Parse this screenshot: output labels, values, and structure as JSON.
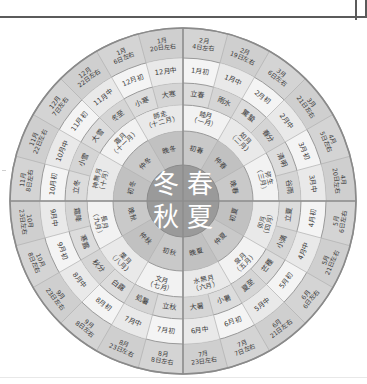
{
  "diagram": {
    "colors": {
      "core": "#9a9a9a",
      "ring_season": "#c9c9c9",
      "ring_month_jp": "#f2f2f2",
      "ring_term": "#dcdcdc",
      "ring_month_mid": "#f4f4f4",
      "ring_date": "#d4d4d4",
      "outline": "#9a9a9a",
      "cross": "#8e8e8e",
      "text": "#3a3a3a"
    },
    "center_seasons": [
      {
        "label": "冬",
        "position": "top-left"
      },
      {
        "label": "春",
        "position": "top-right"
      },
      {
        "label": "秋",
        "position": "bottom-left"
      },
      {
        "label": "夏",
        "position": "bottom-right"
      }
    ],
    "ring_names": {
      "r1_center": "季節",
      "r2": "季節の区分",
      "r3": "和風月名",
      "r4": "二十四節気",
      "r5": "旧暦月",
      "r6": "新暦日付"
    },
    "segments": [
      {
        "i": 0,
        "season": "春",
        "sub_season": "初春",
        "jp_month": "睦月（一月）",
        "term": "立春",
        "lunar": "1月初",
        "date": "2月4日左右"
      },
      {
        "i": 1,
        "season": "春",
        "sub_season": "初春",
        "jp_month": "睦月（一月）",
        "term": "雨水",
        "lunar": "1月中",
        "date": "2月19日左右"
      },
      {
        "i": 2,
        "season": "春",
        "sub_season": "仲春",
        "jp_month": "如月（二月）",
        "term": "驚蟄",
        "lunar": "2月初",
        "date": "3月6日左右"
      },
      {
        "i": 3,
        "season": "春",
        "sub_season": "仲春",
        "jp_month": "如月（二月）",
        "term": "春分",
        "lunar": "2月中",
        "date": "3月21日左右"
      },
      {
        "i": 4,
        "season": "春",
        "sub_season": "晚春",
        "jp_month": "弥生（三月）",
        "term": "清明",
        "lunar": "3月初",
        "date": "4月5日左右"
      },
      {
        "i": 5,
        "season": "春",
        "sub_season": "晚春",
        "jp_month": "弥生（三月）",
        "term": "谷雨",
        "lunar": "3月中",
        "date": "4月20日左右"
      },
      {
        "i": 6,
        "season": "夏",
        "sub_season": "初夏",
        "jp_month": "卯月（四月）",
        "term": "立夏",
        "lunar": "4月初",
        "date": "5月6日左右"
      },
      {
        "i": 7,
        "season": "夏",
        "sub_season": "初夏",
        "jp_month": "卯月（四月）",
        "term": "小満",
        "lunar": "4月中",
        "date": "5月21日左右"
      },
      {
        "i": 8,
        "season": "夏",
        "sub_season": "仲夏",
        "jp_month": "皐月（五月）",
        "term": "芒種",
        "lunar": "5月初",
        "date": "6月6日左右"
      },
      {
        "i": 9,
        "season": "夏",
        "sub_season": "仲夏",
        "jp_month": "皐月（五月）",
        "term": "夏至",
        "lunar": "5月中",
        "date": "6月21日左右"
      },
      {
        "i": 10,
        "season": "夏",
        "sub_season": "晚夏",
        "jp_month": "水無月（六月）",
        "term": "小暑",
        "lunar": "6月初",
        "date": "7月7日左右"
      },
      {
        "i": 11,
        "season": "夏",
        "sub_season": "晚夏",
        "jp_month": "水無月（六月）",
        "term": "大暑",
        "lunar": "6月中",
        "date": "7月23日左右"
      },
      {
        "i": 12,
        "season": "秋",
        "sub_season": "初秋",
        "jp_month": "文月（七月）",
        "term": "立秋",
        "lunar": "7月初",
        "date": "8月8日左右"
      },
      {
        "i": 13,
        "season": "秋",
        "sub_season": "初秋",
        "jp_month": "文月（七月）",
        "term": "処暑",
        "lunar": "7月中",
        "date": "8月23日左右"
      },
      {
        "i": 14,
        "season": "秋",
        "sub_season": "仲秋",
        "jp_month": "葉月（八月）",
        "term": "白露",
        "lunar": "8月初",
        "date": "9月8日左右"
      },
      {
        "i": 15,
        "season": "秋",
        "sub_season": "仲秋",
        "jp_month": "葉月（八月）",
        "term": "秋分",
        "lunar": "8月中",
        "date": "9月23日左右"
      },
      {
        "i": 16,
        "season": "秋",
        "sub_season": "晚秋",
        "jp_month": "長月（九月）",
        "term": "寒露",
        "lunar": "9月初",
        "date": "10月8日左右"
      },
      {
        "i": 17,
        "season": "秋",
        "sub_season": "晚秋",
        "jp_month": "長月（九月）",
        "term": "霜降",
        "lunar": "9月中",
        "date": "10月23日左右"
      },
      {
        "i": 18,
        "season": "冬",
        "sub_season": "初冬",
        "jp_month": "神無月（十月）",
        "term": "立冬",
        "lunar": "10月初",
        "date": "11月8日左右"
      },
      {
        "i": 19,
        "season": "冬",
        "sub_season": "初冬",
        "jp_month": "神無月（十月）",
        "term": "小雪",
        "lunar": "10月中",
        "date": "11月22日左右"
      },
      {
        "i": 20,
        "season": "冬",
        "sub_season": "仲冬",
        "jp_month": "霜月（十一月）",
        "term": "大雪",
        "lunar": "11月初",
        "date": "12月7日左右"
      },
      {
        "i": 21,
        "season": "冬",
        "sub_season": "仲冬",
        "jp_month": "霜月（十一月）",
        "term": "冬至",
        "lunar": "11月中",
        "date": "12月22日左右"
      },
      {
        "i": 22,
        "season": "冬",
        "sub_season": "晚冬",
        "jp_month": "師走（十二月）",
        "term": "小寒",
        "lunar": "12月初",
        "date": "1月6日左右"
      },
      {
        "i": 23,
        "season": "冬",
        "sub_season": "晚冬",
        "jp_month": "師走（十二月）",
        "term": "大寒",
        "lunar": "12月中",
        "date": "1月20日左右"
      }
    ]
  }
}
